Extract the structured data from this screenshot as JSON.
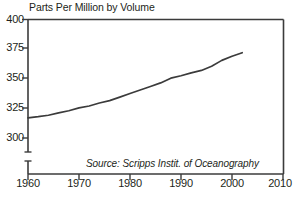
{
  "chart_data": {
    "type": "line",
    "title": "Parts Per Million by Volume",
    "xlabel": "",
    "ylabel": "",
    "xlim": [
      1960,
      2010
    ],
    "ylim": [
      295,
      400
    ],
    "ytick_values": [
      400,
      375,
      350,
      325,
      300
    ],
    "ytick_labels": [
      "400",
      "375",
      "350",
      "325",
      "300"
    ],
    "xtick_values": [
      1960,
      1970,
      1980,
      1990,
      2000,
      2010
    ],
    "xtick_labels": [
      "1960",
      "1970",
      "1980",
      "1990",
      "2000",
      "2010"
    ],
    "grid": false,
    "legend": null,
    "axis_break": true,
    "annotations": [
      {
        "name": "source-note",
        "text": "Source: Scripps Instit. of Oceanography",
        "style": "italic"
      }
    ],
    "series": [
      {
        "name": "Atmospheric CO2 concentration",
        "color": "#3b3b3b",
        "x": [
          1960,
          1962,
          1964,
          1966,
          1968,
          1970,
          1972,
          1974,
          1976,
          1978,
          1980,
          1982,
          1984,
          1986,
          1988,
          1990,
          1992,
          1994,
          1996,
          1998,
          2000,
          2002
        ],
        "values": [
          317.0,
          318.0,
          319.2,
          321.2,
          323.0,
          325.4,
          327.0,
          329.5,
          331.5,
          334.5,
          337.5,
          340.5,
          343.5,
          346.5,
          350.5,
          352.5,
          355.0,
          357.0,
          360.5,
          365.5,
          369.0,
          372.0
        ]
      }
    ]
  },
  "axes": {
    "y_labels": [
      "400",
      "375",
      "350",
      "325",
      "300"
    ],
    "x_labels": [
      "1960",
      "1970",
      "1980",
      "1990",
      "2000",
      "2010"
    ]
  },
  "title": "Parts Per Million by Volume",
  "source": "Source: Scripps Instit. of Oceanography"
}
